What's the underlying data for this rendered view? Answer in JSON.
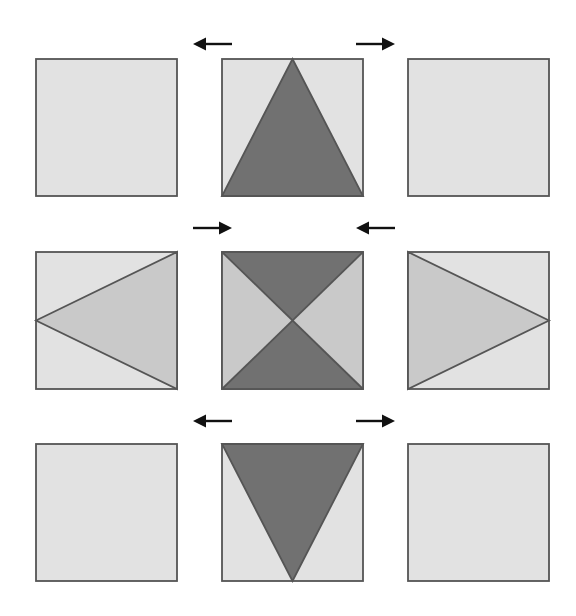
{
  "figure": {
    "width": 576,
    "height": 616,
    "background_color": "#ffffff"
  },
  "palette": {
    "light_gray": "#e2e2e2",
    "medium_gray": "#c9c9c9",
    "dark_gray": "#717171",
    "outline": "#555555",
    "arrow_color": "#111111",
    "background": "#ffffff"
  },
  "grid": {
    "columns": 3,
    "rows": 3,
    "cell_width": 141,
    "cell_height": 137,
    "column_x": [
      36,
      222,
      408
    ],
    "row_y": [
      59,
      252,
      444
    ]
  },
  "cells": [
    {
      "id": "cell-r1c1",
      "row": 1,
      "column": 1,
      "x": 36,
      "y": 59,
      "fill_name": "plain-light-square",
      "fill_color": "#e2e2e2",
      "shape": "none",
      "shape_color": null,
      "description": "Empty light gray square"
    },
    {
      "id": "cell-r1c2",
      "row": 1,
      "column": 2,
      "x": 222,
      "y": 59,
      "fill_name": "triangle-up",
      "fill_color": "#e2e2e2",
      "shape": "triangle-up",
      "shape_color": "#717171",
      "description": "Dark gray triangle pointing up, apex at top center, base along bottom edge"
    },
    {
      "id": "cell-r1c3",
      "row": 1,
      "column": 3,
      "x": 408,
      "y": 59,
      "fill_name": "plain-light-square",
      "fill_color": "#e2e2e2",
      "shape": "none",
      "shape_color": null,
      "description": "Empty light gray square"
    },
    {
      "id": "cell-r2c1",
      "row": 2,
      "column": 1,
      "x": 36,
      "y": 252,
      "fill_name": "triangle-left",
      "fill_color": "#e2e2e2",
      "shape": "triangle-left",
      "shape_color": "#c9c9c9",
      "description": "Medium gray triangle pointing left, apex at left center, base along right edge"
    },
    {
      "id": "cell-r2c2",
      "row": 2,
      "column": 2,
      "x": 222,
      "y": 252,
      "fill_name": "bowtie-four-triangles",
      "fill_color": "#e2e2e2",
      "shape": "bowtie",
      "shape_color": "#717171",
      "secondary_color": "#c9c9c9",
      "description": "Four triangles from corner diagonals: top and bottom dark gray, left and right light gray"
    },
    {
      "id": "cell-r2c3",
      "row": 2,
      "column": 3,
      "x": 408,
      "y": 252,
      "fill_name": "triangle-right",
      "fill_color": "#e2e2e2",
      "shape": "triangle-right",
      "shape_color": "#c9c9c9",
      "description": "Medium gray triangle pointing right, base along left edge, apex at right center"
    },
    {
      "id": "cell-r3c1",
      "row": 3,
      "column": 1,
      "x": 36,
      "y": 444,
      "fill_name": "plain-light-square",
      "fill_color": "#e2e2e2",
      "shape": "none",
      "shape_color": null,
      "description": "Empty light gray square"
    },
    {
      "id": "cell-r3c2",
      "row": 3,
      "column": 2,
      "x": 222,
      "y": 444,
      "fill_name": "triangle-down",
      "fill_color": "#e2e2e2",
      "shape": "triangle-down",
      "shape_color": "#717171",
      "description": "Dark gray inverted triangle, base along top edge, apex at bottom center"
    },
    {
      "id": "cell-r3c3",
      "row": 3,
      "column": 3,
      "x": 408,
      "y": 444,
      "fill_name": "plain-light-square",
      "fill_color": "#e2e2e2",
      "shape": "none",
      "shape_color": null,
      "description": "Empty light gray square"
    }
  ],
  "arrows": [
    {
      "id": "arrow-top-left",
      "direction": "left",
      "x1": 232,
      "x2": 193,
      "y": 44,
      "label": "points left"
    },
    {
      "id": "arrow-top-right",
      "direction": "right",
      "x1": 356,
      "x2": 395,
      "y": 44,
      "label": "points right"
    },
    {
      "id": "arrow-middle-left",
      "direction": "right",
      "x1": 193,
      "x2": 232,
      "y": 228,
      "label": "points right"
    },
    {
      "id": "arrow-middle-right",
      "direction": "left",
      "x1": 395,
      "x2": 356,
      "y": 228,
      "label": "points left"
    },
    {
      "id": "arrow-bottom-left",
      "direction": "left",
      "x1": 232,
      "x2": 193,
      "y": 421,
      "label": "points left"
    },
    {
      "id": "arrow-bottom-right",
      "direction": "right",
      "x1": 356,
      "x2": 395,
      "y": 421,
      "label": "points right"
    }
  ]
}
